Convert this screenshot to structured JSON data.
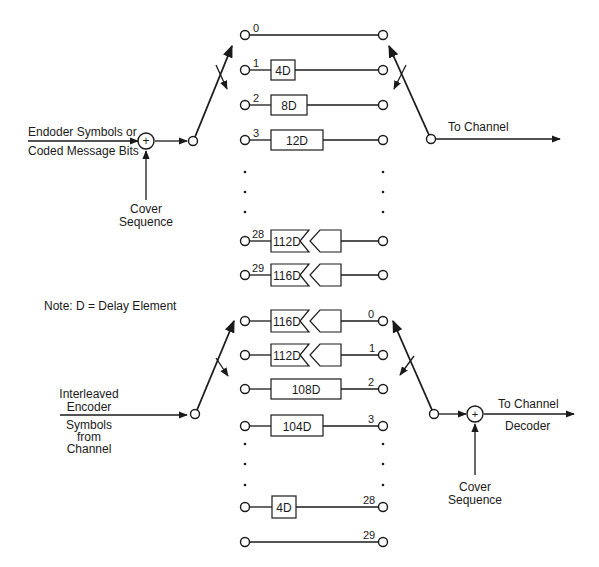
{
  "interleaver": {
    "input_label_line1": "Endoder Symbols or",
    "input_label_line2": "Coded Message Bits",
    "adder_symbol": "+",
    "cover_label_line1": "Cover",
    "cover_label_line2": "Sequence",
    "output_label": "To Channel",
    "branches": [
      {
        "index": "0",
        "delay": ""
      },
      {
        "index": "1",
        "delay": "4D"
      },
      {
        "index": "2",
        "delay": "8D"
      },
      {
        "index": "3",
        "delay": "12D"
      },
      {
        "index": "28",
        "delay": "112D"
      },
      {
        "index": "29",
        "delay": "116D"
      }
    ]
  },
  "note": "Note:  D = Delay Element",
  "deinterleaver": {
    "input_label_line1": "Interleaved",
    "input_label_line2": "Encoder",
    "input_label_line3": "Symbols",
    "input_label_line4": "from",
    "input_label_line5": "Channel",
    "adder_symbol": "+",
    "cover_label_line1": "Cover",
    "cover_label_line2": "Sequence",
    "output_label_line1": "To Channel",
    "output_label_line2": "Decoder",
    "branches": [
      {
        "index": "0",
        "delay": "116D"
      },
      {
        "index": "1",
        "delay": "112D"
      },
      {
        "index": "2",
        "delay": "108D"
      },
      {
        "index": "3",
        "delay": "104D"
      },
      {
        "index": "28",
        "delay": "4D"
      },
      {
        "index": "29",
        "delay": ""
      }
    ]
  },
  "colors": {
    "line": "#1a1a1a",
    "background": "#ffffff"
  }
}
